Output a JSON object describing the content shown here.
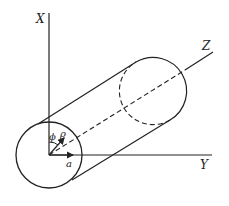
{
  "diagram": {
    "axes": {
      "x_label": "X",
      "y_label": "Y",
      "z_label": "Z"
    },
    "symbols": {
      "phi": "ϕ",
      "rho": "ρ",
      "a": "a"
    },
    "stroke_color": "#222222",
    "background": "#ffffff"
  }
}
